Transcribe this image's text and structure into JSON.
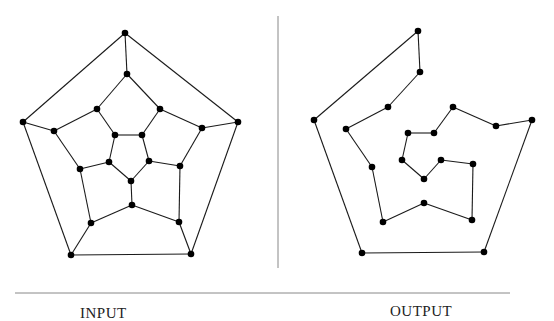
{
  "labels": {
    "input": "INPUT",
    "output": "OUTPUT"
  },
  "colors": {
    "edge": "#1a1a1a",
    "node": "#000000",
    "divider": "#888888"
  },
  "input_graph": {
    "description": "Dodecahedral graph (20 vertices, 30 edges)",
    "nodes": [
      [
        125,
        33
      ],
      [
        23,
        122
      ],
      [
        238,
        122
      ],
      [
        71,
        255
      ],
      [
        191,
        254
      ],
      [
        127,
        74
      ],
      [
        97,
        109
      ],
      [
        160,
        109
      ],
      [
        54,
        131
      ],
      [
        202,
        128
      ],
      [
        80,
        169
      ],
      [
        180,
        166
      ],
      [
        91,
        223
      ],
      [
        179,
        222
      ],
      [
        132,
        205
      ],
      [
        115,
        135
      ],
      [
        142,
        135
      ],
      [
        109,
        162
      ],
      [
        149,
        161
      ],
      [
        131,
        181
      ]
    ],
    "edges": [
      [
        0,
        1
      ],
      [
        0,
        2
      ],
      [
        1,
        3
      ],
      [
        2,
        4
      ],
      [
        3,
        4
      ],
      [
        0,
        5
      ],
      [
        1,
        8
      ],
      [
        2,
        9
      ],
      [
        3,
        12
      ],
      [
        4,
        13
      ],
      [
        5,
        6
      ],
      [
        5,
        7
      ],
      [
        6,
        8
      ],
      [
        7,
        9
      ],
      [
        8,
        10
      ],
      [
        9,
        11
      ],
      [
        10,
        12
      ],
      [
        11,
        13
      ],
      [
        12,
        14
      ],
      [
        13,
        14
      ],
      [
        6,
        15
      ],
      [
        7,
        16
      ],
      [
        10,
        17
      ],
      [
        11,
        18
      ],
      [
        14,
        19
      ],
      [
        15,
        16
      ],
      [
        16,
        18
      ],
      [
        18,
        19
      ],
      [
        19,
        17
      ],
      [
        17,
        15
      ]
    ]
  },
  "output_graph": {
    "description": "Hamiltonian cycle of the dodecahedral graph",
    "path": [
      [
        418,
        31
      ],
      [
        420,
        72
      ],
      [
        388,
        107
      ],
      [
        346,
        129
      ],
      [
        372,
        167
      ],
      [
        383,
        222
      ],
      [
        424,
        203
      ],
      [
        472,
        220
      ],
      [
        473,
        164
      ],
      [
        441,
        160
      ],
      [
        424,
        179
      ],
      [
        402,
        160
      ],
      [
        408,
        133
      ],
      [
        434,
        133
      ],
      [
        453,
        107
      ],
      [
        496,
        126
      ],
      [
        532,
        120
      ],
      [
        484,
        252
      ],
      [
        362,
        253
      ],
      [
        314,
        120
      ]
    ],
    "closed": true
  },
  "dividers": {
    "vertical": {
      "x": 278,
      "y1": 16,
      "y2": 268
    },
    "horizontal": {
      "y": 293,
      "x1": 15,
      "x2": 510
    }
  }
}
